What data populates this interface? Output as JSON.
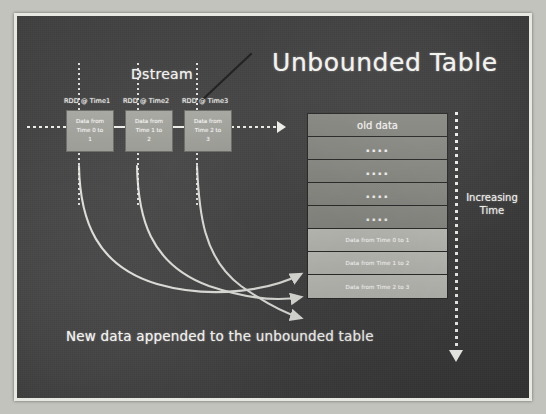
{
  "slide": {
    "title_unbounded": "Unbounded Table",
    "label_dstream": "Dstream",
    "label_increasing_time": "Increasing Time",
    "caption": "New data appended to the unbounded table"
  },
  "dstream": {
    "rdds": [
      {
        "label": "RDD @ Time1",
        "line1": "Data from",
        "line2": "Time 0 to",
        "line3": "1"
      },
      {
        "label": "RDD @ Time2",
        "line1": "Data from",
        "line2": "Time 1 to",
        "line3": "2"
      },
      {
        "label": "RDD @ Time3",
        "line1": "Data from",
        "line2": "Time 2 to",
        "line3": "3"
      }
    ]
  },
  "table": {
    "rows": [
      {
        "text": "old data",
        "kind": "header"
      },
      {
        "text": "....",
        "kind": "dots"
      },
      {
        "text": "....",
        "kind": "dots"
      },
      {
        "text": "....",
        "kind": "dots"
      },
      {
        "text": "....",
        "kind": "dots"
      },
      {
        "text": "Data from Time 0 to 1",
        "kind": "newdata"
      },
      {
        "text": "Data from Time 1 to 2",
        "kind": "newdata"
      },
      {
        "text": "Data from Time 2 to 3",
        "kind": "newdata"
      }
    ]
  },
  "colors": {
    "board": "#414141",
    "chalk": "#f2f2ee",
    "frame": "#e8e8e3",
    "row_old": "#888883",
    "row_new": "#b9b9b4",
    "rdd_box": "#a5a5a0"
  }
}
